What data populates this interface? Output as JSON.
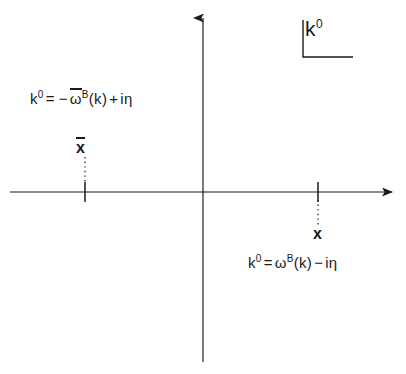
{
  "figure": {
    "type": "complex-plane-contour-diagram",
    "background_color": "#ffffff",
    "ink_color": "#1a1a1a",
    "axis_label": {
      "name": "k0-plane-label",
      "base": "k",
      "superscript": "0",
      "full_text": "k0",
      "bracket": "L-shaped corner bracket"
    },
    "axes": {
      "origin": {
        "x": 203,
        "y": 192
      },
      "horizontal": {
        "name": "real-axis",
        "x_start": 10,
        "x_end": 396,
        "y": 192,
        "arrow": "right"
      },
      "vertical": {
        "name": "imaginary-axis",
        "y_start": 14,
        "y_end": 362,
        "x": 203,
        "arrow": "up"
      }
    },
    "poles": [
      {
        "name": "pole-negative-frequency",
        "marker_symbol": "x",
        "marker_has_overline": true,
        "marker_label": "x̄",
        "tick_x": 85,
        "tick_y": 192,
        "marker_x": 85,
        "marker_y": 148,
        "side": "upper-left",
        "dotted_connector": true,
        "equation": {
          "lhs_base": "k",
          "lhs_sup": "0",
          "equals": "=",
          "sign": "−",
          "omega": "ω",
          "omega_overline": true,
          "omega_sup": "B",
          "argument": "(k)",
          "tail_op": "+",
          "tail": "iη",
          "full_text": "k0 = − ω̄B(k) + iη"
        }
      },
      {
        "name": "pole-positive-frequency",
        "marker_symbol": "x",
        "marker_has_overline": false,
        "marker_label": "x",
        "tick_x": 318,
        "tick_y": 192,
        "marker_x": 318,
        "marker_y": 234,
        "side": "lower-right",
        "dotted_connector": true,
        "equation": {
          "lhs_base": "k",
          "lhs_sup": "0",
          "equals": "=",
          "sign": "",
          "omega": "ω",
          "omega_overline": false,
          "omega_sup": "B",
          "argument": "(k)",
          "tail_op": "−",
          "tail": "iη",
          "full_text": "k0 = ωB(k) − iη"
        }
      }
    ]
  }
}
